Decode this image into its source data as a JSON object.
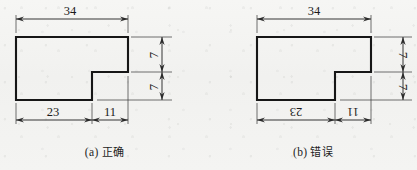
{
  "figure": {
    "stroke_color": "#161616",
    "dimension_color": "#2a2a2a",
    "background_color": "#f4f4f2"
  },
  "panels": [
    {
      "id": "a",
      "caption_label": "(a)",
      "caption_word": "正确",
      "part_shape": "L-shaped-bracket",
      "dimensions": {
        "top_width": "34",
        "bottom_left": "23",
        "bottom_right": "11",
        "right_upper": "7",
        "right_lower": "7"
      },
      "text_orientation": {
        "top_width": "upright",
        "bottom_left": "upright",
        "bottom_right": "upright",
        "right_upper": "rotated-ccw",
        "right_lower": "rotated-ccw"
      }
    },
    {
      "id": "b",
      "caption_label": "(b)",
      "caption_word": "错误",
      "part_shape": "L-shaped-bracket",
      "dimensions": {
        "top_width": "34",
        "bottom_left": "23",
        "bottom_right": "11",
        "right_upper": "7",
        "right_lower": "7"
      },
      "text_orientation": {
        "top_width": "upright",
        "bottom_left": "upside-down",
        "bottom_right": "upside-down",
        "right_upper": "rotated-cw",
        "right_lower": "rotated-cw"
      }
    }
  ]
}
